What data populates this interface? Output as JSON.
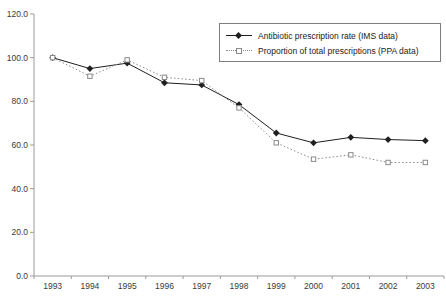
{
  "chart_data": {
    "type": "line",
    "title": "",
    "xlabel": "",
    "ylabel": "",
    "categories": [
      "1993",
      "1994",
      "1995",
      "1996",
      "1997",
      "1998",
      "1999",
      "2000",
      "2001",
      "2002",
      "2003"
    ],
    "series": [
      {
        "name": "Antibiotic prescription rate (IMS data)",
        "values": [
          100,
          95,
          97.5,
          88.5,
          87.5,
          78.5,
          65.5,
          61,
          63.5,
          62.5,
          62
        ],
        "line": "solid",
        "marker": "filled-diamond",
        "color": "#1f1f1f"
      },
      {
        "name": "Proportion of total prescriptions (PPA data)",
        "values": [
          100,
          91.5,
          99,
          91,
          89.5,
          77,
          61,
          53.5,
          55.5,
          52,
          52
        ],
        "line": "dotted",
        "marker": "open-square",
        "color": "#8a8a8a"
      }
    ],
    "ylim": [
      0,
      120
    ],
    "ytick_labels": [
      "0.0",
      "20.0",
      "40.0",
      "60.0",
      "80.0",
      "100.0",
      "120.0"
    ],
    "grid": false,
    "legend_position": "top-right",
    "axis_color": "#9b9b9b",
    "tick_label_color": "#3a3a3a"
  }
}
